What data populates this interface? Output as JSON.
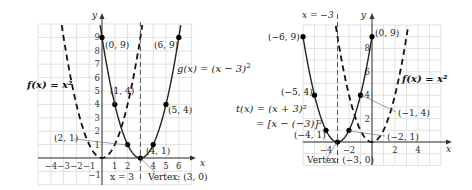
{
  "chart_data": [
    {
      "type": "line",
      "title": "Horizontal shift right by 3",
      "xlabel": "x",
      "ylabel": "y",
      "xlim": [
        -5,
        7
      ],
      "ylim": [
        -2,
        10
      ],
      "grid": true,
      "x_ticks": [
        "−4",
        "−3",
        "−2",
        "−1",
        "1",
        "2",
        "4",
        "5",
        "6"
      ],
      "x_tick_values": [
        -4,
        -3,
        -2,
        -1,
        1,
        2,
        4,
        5,
        6
      ],
      "y_ticks": [
        "1",
        "2",
        "3",
        "4",
        "5",
        "6",
        "7",
        "8",
        "9",
        "−1"
      ],
      "y_tick_values": [
        1,
        2,
        3,
        4,
        5,
        6,
        7,
        8,
        9,
        -1
      ],
      "series": [
        {
          "name": "f(x) = x²",
          "style": "dashed",
          "formula": "x^2",
          "x_range": [
            -3.2,
            3.2
          ]
        },
        {
          "name": "g(x) = (x − 3)²",
          "style": "solid",
          "formula": "(x-3)^2",
          "x_range": [
            -0.2,
            6.2
          ],
          "points": [
            [
              0,
              9
            ],
            [
              1,
              4
            ],
            [
              2,
              1
            ],
            [
              3,
              0
            ],
            [
              4,
              1
            ],
            [
              5,
              4
            ],
            [
              6,
              9
            ]
          ]
        }
      ],
      "asymptote": {
        "type": "vertical",
        "x": 3,
        "label": "x = 3",
        "style": "dashed"
      },
      "annotations": [
        {
          "text": "(0, 9)",
          "x": 0,
          "y": 9
        },
        {
          "text": "(6, 9)",
          "x": 6,
          "y": 9
        },
        {
          "text": "(1, 4)",
          "x": 1,
          "y": 4
        },
        {
          "text": "(5, 4)",
          "x": 5,
          "y": 4
        },
        {
          "text": "(2, 1)",
          "x": 2,
          "y": 1
        },
        {
          "text": "(4, 1)",
          "x": 4,
          "y": 1
        },
        {
          "text": "Vertex: (3, 0)",
          "x": 3,
          "y": 0
        }
      ],
      "legend": [
        {
          "label": "f(x) = x²",
          "position": "left"
        },
        {
          "label": "g(x) = (x − 3)²",
          "position": "right"
        }
      ]
    },
    {
      "type": "line",
      "title": "Horizontal shift left by 3",
      "xlabel": "x",
      "ylabel": "y",
      "xlim": [
        -6,
        6
      ],
      "ylim": [
        -2,
        10
      ],
      "grid": true,
      "x_ticks": [
        "−4",
        "−2",
        "2",
        "4"
      ],
      "x_tick_values": [
        -4,
        -2,
        2,
        4
      ],
      "y_ticks": [
        "2",
        "4",
        "6",
        "8"
      ],
      "y_tick_values": [
        2,
        4,
        6,
        8
      ],
      "series": [
        {
          "name": "f(x) = x²",
          "style": "dashed",
          "formula": "x^2",
          "x_range": [
            -3.2,
            3.2
          ]
        },
        {
          "name": "t(x) = (x + 3)² = [x − (−3)]²",
          "style": "solid",
          "formula": "(x+3)^2",
          "x_range": [
            -6,
            0
          ],
          "points": [
            [
              -6,
              9
            ],
            [
              -5,
              4
            ],
            [
              -4,
              1
            ],
            [
              -3,
              0
            ],
            [
              -2,
              1
            ],
            [
              -1,
              4
            ],
            [
              0,
              9
            ]
          ]
        }
      ],
      "asymptote": {
        "type": "vertical",
        "x": -3,
        "label": "x = −3",
        "style": "dashed"
      },
      "annotations": [
        {
          "text": "(−6, 9)",
          "x": -6,
          "y": 9
        },
        {
          "text": "(0, 9)",
          "x": 0,
          "y": 9
        },
        {
          "text": "(−5, 4)",
          "x": -5,
          "y": 4
        },
        {
          "text": "(−1, 4)",
          "x": -1,
          "y": 4
        },
        {
          "text": "(−4, 1)",
          "x": -4,
          "y": 1
        },
        {
          "text": "(−2, 1)",
          "x": -2,
          "y": 1
        },
        {
          "text": "Vertex: (−3, 0)",
          "x": -3,
          "y": 0
        }
      ],
      "legend": [
        {
          "label": "t(x) = (x + 3)²",
          "position": "left"
        },
        {
          "label": "= [x − (−3)]²",
          "position": "left"
        },
        {
          "label": "f(x) = x²",
          "position": "right"
        }
      ]
    }
  ],
  "left": {
    "y_label": "y",
    "x_label": "x",
    "f_label": "f(x) = x²",
    "g_label_pre": "g(x) = (x − 3)",
    "g_label_exp": "2",
    "asym_label": "x = 3",
    "vertex_label": "Vertex: (3, 0)",
    "pt_0_9": "(0, 9)",
    "pt_6_9": "(6, 9)",
    "pt_1_4": "(1, 4)",
    "pt_5_4": "(5, 4)",
    "pt_2_1": "(2, 1)",
    "pt_4_1": "(4, 1)"
  },
  "right": {
    "y_label": "y",
    "x_label": "x",
    "f_label": "f(x) = x²",
    "t_label_1": "t(x) = (x + 3)²",
    "t_label_2": "= [x − (−3)]²",
    "asym_label": "x = −3",
    "vertex_label": "Vertex: (−3, 0)",
    "pt_m6_9": "(−6, 9)",
    "pt_0_9": "(0, 9)",
    "pt_m5_4": "(−5, 4)",
    "pt_m1_4": "(−1, 4)",
    "pt_m4_1": "(−4, 1)",
    "pt_m2_1": "(−2, 1)"
  }
}
